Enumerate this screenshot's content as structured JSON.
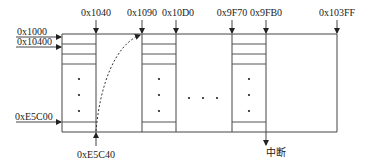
{
  "diagram": {
    "top_labels": [
      {
        "text": "0x1040",
        "x": 96
      },
      {
        "text": "0x1090",
        "x": 142
      },
      {
        "text": "0x10D0",
        "x": 176
      },
      {
        "text": "0x9F70",
        "x": 232
      },
      {
        "text": "0x9FB0",
        "x": 266
      },
      {
        "text": "0x103FF",
        "x": 337
      }
    ],
    "left_labels": [
      {
        "text": "0x1000",
        "y": 37
      },
      {
        "text": "0x10400",
        "y": 47
      },
      {
        "text": "0xE5C00",
        "y": 122
      }
    ],
    "bottom_labels": [
      {
        "text": "0xE5C40",
        "x": 96,
        "direction": "up"
      },
      {
        "text": "中断",
        "x": 266,
        "direction": "down"
      }
    ],
    "ellipsis": "• • •",
    "colors": {
      "line": "#444444",
      "text": "#222222",
      "background": "#ffffff"
    }
  }
}
